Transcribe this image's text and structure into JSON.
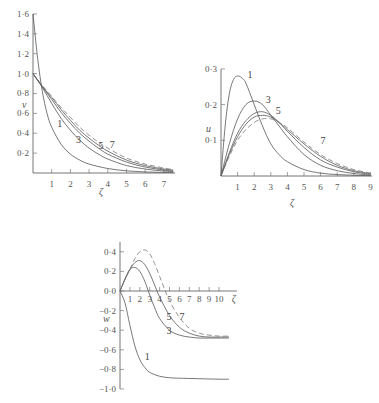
{
  "chart_data": [
    {
      "id": "v-chart",
      "type": "line",
      "title": "",
      "xlabel": "ζ",
      "ylabel": "v",
      "xlim": [
        0,
        7.5
      ],
      "ylim": [
        0,
        1.6
      ],
      "grid": false,
      "xticks": [
        "1",
        "2",
        "3",
        "4",
        "5",
        "6",
        "7"
      ],
      "yticks": [
        "0·2",
        "0·4",
        "0·6",
        "0·8",
        "1·0",
        "1·2",
        "1·4",
        "1·6"
      ],
      "series": [
        {
          "name": "1",
          "x": [
            0,
            0.25,
            0.5,
            0.75,
            1,
            1.5,
            2,
            2.5,
            3,
            4,
            5,
            6,
            7,
            7.5
          ],
          "values": [
            1.6,
            1.15,
            0.82,
            0.6,
            0.46,
            0.29,
            0.19,
            0.13,
            0.09,
            0.045,
            0.022,
            0.011,
            0.006,
            0.004
          ]
        },
        {
          "name": "3",
          "x": [
            0,
            0.5,
            1,
            1.5,
            2,
            2.5,
            3,
            3.5,
            4,
            5,
            6,
            7,
            7.5
          ],
          "values": [
            1.0,
            0.86,
            0.7,
            0.55,
            0.43,
            0.33,
            0.25,
            0.19,
            0.14,
            0.075,
            0.04,
            0.02,
            0.015
          ]
        },
        {
          "name": "5",
          "x": [
            0,
            0.5,
            1,
            1.5,
            2,
            2.5,
            3,
            3.5,
            4,
            5,
            6,
            7,
            7.5
          ],
          "values": [
            1.0,
            0.87,
            0.74,
            0.61,
            0.5,
            0.4,
            0.32,
            0.25,
            0.19,
            0.11,
            0.06,
            0.03,
            0.02
          ]
        },
        {
          "name": "7",
          "x": [
            0,
            0.5,
            1,
            1.5,
            2,
            2.5,
            3,
            3.5,
            4,
            5,
            6,
            7,
            7.5
          ],
          "values": [
            1.0,
            0.87,
            0.76,
            0.64,
            0.53,
            0.43,
            0.35,
            0.28,
            0.22,
            0.13,
            0.075,
            0.04,
            0.03
          ]
        },
        {
          "name": "dashed",
          "x": [
            0,
            0.5,
            1,
            1.5,
            2,
            2.5,
            3,
            3.5,
            4,
            5,
            6,
            7,
            7.5
          ],
          "values": [
            1.0,
            0.88,
            0.77,
            0.66,
            0.56,
            0.46,
            0.38,
            0.31,
            0.25,
            0.15,
            0.09,
            0.05,
            0.035
          ]
        }
      ],
      "curve_labels": [
        {
          "text": "1",
          "x": 1.3,
          "y": 0.46
        },
        {
          "text": "3",
          "x": 2.3,
          "y": 0.3
        },
        {
          "text": "5",
          "x": 3.5,
          "y": 0.24
        },
        {
          "text": "7",
          "x": 4.1,
          "y": 0.25
        }
      ]
    },
    {
      "id": "u-chart",
      "type": "line",
      "title": "",
      "xlabel": "ζ",
      "ylabel": "u",
      "xlim": [
        0,
        9
      ],
      "ylim": [
        0,
        0.3
      ],
      "grid": false,
      "xticks": [
        "1",
        "2",
        "3",
        "4",
        "5",
        "6",
        "7",
        "8",
        "9"
      ],
      "yticks": [
        "0·1",
        "0·2",
        "0·3"
      ],
      "series": [
        {
          "name": "1",
          "x": [
            0,
            0.25,
            0.5,
            0.75,
            1,
            1.25,
            1.5,
            2,
            2.5,
            3,
            3.5,
            4,
            5,
            6,
            7,
            8,
            9
          ],
          "values": [
            0,
            0.14,
            0.23,
            0.27,
            0.28,
            0.275,
            0.26,
            0.2,
            0.14,
            0.09,
            0.06,
            0.04,
            0.018,
            0.008,
            0.004,
            0.002,
            0.001
          ]
        },
        {
          "name": "3",
          "x": [
            0,
            0.5,
            1,
            1.5,
            2,
            2.5,
            3,
            3.5,
            4,
            5,
            6,
            7,
            8,
            9
          ],
          "values": [
            0,
            0.09,
            0.16,
            0.2,
            0.21,
            0.2,
            0.17,
            0.14,
            0.11,
            0.06,
            0.03,
            0.015,
            0.007,
            0.003
          ]
        },
        {
          "name": "5",
          "x": [
            0,
            0.5,
            1,
            1.5,
            2,
            2.5,
            3,
            3.5,
            4,
            5,
            6,
            7,
            8,
            9
          ],
          "values": [
            0,
            0.065,
            0.12,
            0.155,
            0.175,
            0.18,
            0.17,
            0.15,
            0.125,
            0.08,
            0.045,
            0.025,
            0.012,
            0.005
          ]
        },
        {
          "name": "7",
          "x": [
            0,
            0.5,
            1,
            1.5,
            2,
            2.5,
            3,
            3.5,
            4,
            5,
            6,
            7,
            8,
            9
          ],
          "values": [
            0,
            0.06,
            0.11,
            0.145,
            0.165,
            0.17,
            0.165,
            0.15,
            0.13,
            0.09,
            0.055,
            0.03,
            0.015,
            0.007
          ]
        },
        {
          "name": "dashed",
          "x": [
            0,
            0.5,
            1,
            1.5,
            2,
            2.5,
            3,
            3.5,
            4,
            5,
            6,
            7,
            8,
            9
          ],
          "values": [
            0,
            0.055,
            0.1,
            0.13,
            0.15,
            0.16,
            0.16,
            0.15,
            0.135,
            0.095,
            0.06,
            0.035,
            0.018,
            0.008
          ]
        }
      ],
      "curve_labels": [
        {
          "text": "1",
          "x": 1.6,
          "y": 0.275
        },
        {
          "text": "3",
          "x": 2.7,
          "y": 0.205
        },
        {
          "text": "5",
          "x": 3.3,
          "y": 0.175
        },
        {
          "text": "7",
          "x": 6.0,
          "y": 0.09
        }
      ]
    },
    {
      "id": "w-chart",
      "type": "line",
      "title": "",
      "xlabel": "ζ",
      "ylabel": "w",
      "xlim": [
        0,
        11
      ],
      "ylim": [
        -1.0,
        0.4
      ],
      "grid": false,
      "xticks": [
        "1",
        "2",
        "3",
        "4",
        "5",
        "6",
        "7",
        "8",
        "9",
        "10"
      ],
      "yticks": [
        "0·4",
        "0·2",
        "0·0",
        "−0·2",
        "−0·4",
        "−0·6",
        "−0·8",
        "−1·0"
      ],
      "series": [
        {
          "name": "1",
          "x": [
            0,
            0.5,
            1,
            1.5,
            2,
            2.5,
            3,
            4,
            5,
            6,
            8,
            10,
            11
          ],
          "values": [
            0,
            -0.12,
            -0.35,
            -0.56,
            -0.7,
            -0.78,
            -0.83,
            -0.87,
            -0.885,
            -0.89,
            -0.895,
            -0.9,
            -0.9
          ]
        },
        {
          "name": "3",
          "x": [
            0,
            0.5,
            1,
            1.5,
            2,
            2.5,
            3,
            3.5,
            4,
            5,
            6,
            7,
            8,
            9,
            10,
            11
          ],
          "values": [
            0,
            0.12,
            0.22,
            0.24,
            0.2,
            0.1,
            -0.04,
            -0.17,
            -0.28,
            -0.4,
            -0.45,
            -0.47,
            -0.48,
            -0.48,
            -0.48,
            -0.48
          ]
        },
        {
          "name": "5",
          "x": [
            0,
            0.5,
            1,
            1.5,
            2,
            2.5,
            3,
            3.5,
            4,
            5,
            6,
            7,
            8,
            9,
            10,
            11
          ],
          "values": [
            0,
            0.12,
            0.22,
            0.29,
            0.31,
            0.27,
            0.18,
            0.06,
            -0.06,
            -0.25,
            -0.37,
            -0.43,
            -0.46,
            -0.47,
            -0.47,
            -0.47
          ]
        },
        {
          "name": "7",
          "x": [
            0,
            0.5,
            1,
            1.5,
            2,
            2.5,
            3,
            3.5,
            4,
            4.5,
            5,
            6,
            7,
            8,
            9,
            10,
            11
          ],
          "values": [
            0,
            0.12,
            0.22,
            0.33,
            0.4,
            0.42,
            0.38,
            0.28,
            0.15,
            0.02,
            -0.1,
            -0.27,
            -0.38,
            -0.43,
            -0.45,
            -0.46,
            -0.46
          ]
        }
      ],
      "curve_labels": [
        {
          "text": "1",
          "x": 2.5,
          "y": -0.7
        },
        {
          "text": "3",
          "x": 4.7,
          "y": -0.44
        },
        {
          "text": "5",
          "x": 4.7,
          "y": -0.3
        },
        {
          "text": "7",
          "x": 6.0,
          "y": -0.3
        }
      ]
    }
  ]
}
